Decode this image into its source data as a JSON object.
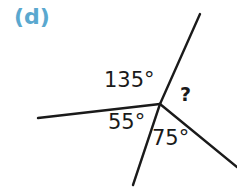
{
  "figure": {
    "part_label": "(d)",
    "part_label_color": "#5aa8cf",
    "stroke_color": "#1a1a1a",
    "background_color": "#ffffff",
    "width": 237,
    "height": 189
  },
  "diagram": {
    "type": "angles-at-a-point",
    "vertex": {
      "x": 160,
      "y": 104
    },
    "rays": [
      {
        "name": "ray-left",
        "x1": 160,
        "y1": 104,
        "x2": 38,
        "y2": 118
      },
      {
        "name": "ray-upper-right",
        "x1": 160,
        "y1": 104,
        "x2": 200,
        "y2": 14
      },
      {
        "name": "ray-lower-right",
        "x1": 160,
        "y1": 104,
        "x2": 237,
        "y2": 167
      },
      {
        "name": "ray-bottom",
        "x1": 160,
        "y1": 104,
        "x2": 133,
        "y2": 185
      }
    ],
    "angles": [
      {
        "id": "a135",
        "label": "135°",
        "value": 135,
        "between": [
          "ray-left",
          "ray-upper-right"
        ]
      },
      {
        "id": "unknown",
        "label": "?",
        "value": null,
        "between": [
          "ray-upper-right",
          "ray-lower-right"
        ]
      },
      {
        "id": "a75",
        "label": "75°",
        "value": 75,
        "between": [
          "ray-lower-right",
          "ray-bottom"
        ]
      },
      {
        "id": "a55",
        "label": "55°",
        "value": 55,
        "between": [
          "ray-bottom",
          "ray-left"
        ]
      }
    ]
  },
  "chart_data": {
    "type": "diagram",
    "title": "(d)",
    "categories": [
      "135°",
      "?",
      "75°",
      "55°"
    ],
    "values": [
      135,
      null,
      75,
      55
    ],
    "total_degrees": 360,
    "unknown_value": 95
  }
}
